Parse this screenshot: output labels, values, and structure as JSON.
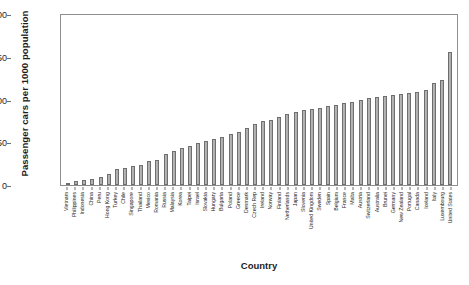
{
  "chart_data": {
    "type": "bar",
    "title": "",
    "xlabel": "Country",
    "ylabel": "Passenger cars per 1000 population",
    "ylim": [
      0,
      1000
    ],
    "yticks": [
      0,
      250,
      500,
      750,
      1000
    ],
    "grid": false,
    "legend": null,
    "orientation": "vertical",
    "bar_color": "#b5b5b5",
    "bar_edge_color": "#6f6f6f",
    "categories": [
      "Vietnam",
      "Philippines",
      "Indonesia",
      "China",
      "Peru",
      "Hong Kong",
      "Turkey",
      "Chile",
      "Singapore",
      "Thailand",
      "Mexico",
      "Romania",
      "Russia",
      "Malaysia",
      "Korea",
      "Taipei",
      "Israel",
      "Slovakia",
      "Hungary",
      "Bulgaria",
      "Poland",
      "Greece",
      "Denmark",
      "Czech Rep",
      "Ireland",
      "Norway",
      "Finland",
      "Netherlands",
      "Japan",
      "Slovenia",
      "United Kingdom",
      "Sweden",
      "Spain",
      "Belgium",
      "France",
      "Malta",
      "Austria",
      "Switzerland",
      "Australia",
      "Brunei",
      "Germany",
      "New Zealand",
      "Portugal",
      "Canada",
      "Iceland",
      "Italy",
      "Luxembourg",
      "United States"
    ],
    "values": [
      14,
      22,
      32,
      37,
      45,
      62,
      95,
      100,
      110,
      120,
      140,
      150,
      185,
      200,
      215,
      228,
      250,
      258,
      270,
      285,
      300,
      310,
      335,
      360,
      375,
      385,
      400,
      420,
      430,
      440,
      450,
      455,
      465,
      470,
      480,
      490,
      500,
      510,
      520,
      525,
      530,
      535,
      540,
      545,
      560,
      600,
      620,
      780
    ]
  }
}
